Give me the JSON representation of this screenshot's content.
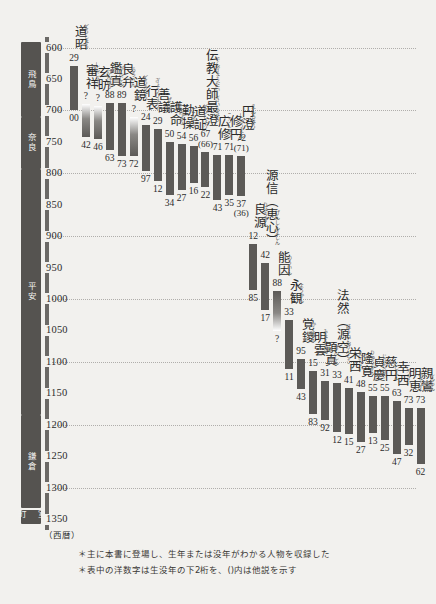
{
  "chart_data": {
    "type": "bar",
    "title": "",
    "xlabel": "",
    "ylabel": "西暦",
    "ylim": [
      575,
      1360
    ],
    "grid": true,
    "orientation": "vertical-range-bars",
    "axis_unit": "（西暦）",
    "ticks": [
      600,
      650,
      700,
      750,
      800,
      850,
      900,
      950,
      1000,
      1050,
      1100,
      1150,
      1200,
      1250,
      1300,
      1350
    ],
    "gridlines": [
      600,
      700,
      800,
      900,
      1000,
      1100,
      1200,
      1300
    ],
    "eras": [
      {
        "label": "飛鳥",
        "start": 592,
        "end": 710
      },
      {
        "label": "奈良",
        "start": 710,
        "end": 794
      },
      {
        "label": "平安",
        "start": 794,
        "end": 1185
      },
      {
        "label": "鎌倉",
        "start": 1185,
        "end": 1333
      },
      {
        "label": "室町",
        "start": 1336,
        "end": 1360
      }
    ],
    "categories": [
      "道昭",
      "審祥",
      "玄昉",
      "鑑真",
      "良弁",
      "道鏡",
      "行表",
      "善議",
      "護命",
      "勤操",
      "道証",
      "伝教大師最澄",
      "広修",
      "修円",
      "円澄",
      "良源",
      "源信（恵心）",
      "能因",
      "永観",
      "覚鑁",
      "明雲",
      "顕真",
      "法然（源空）",
      "栄西",
      "隆寛",
      "貞慶",
      "慈円",
      "幸西",
      "明恵",
      "親鸞"
    ],
    "series": [
      {
        "name": "道昭",
        "ruby": "どうしょう",
        "birth_label": "29",
        "death_label": "00",
        "birth_year": 629,
        "death_year": 700,
        "birth_alt": "",
        "death_alt": "",
        "fade_top": false,
        "fade_bottom": false
      },
      {
        "name": "審祥",
        "ruby": "しんじょう",
        "birth_label": "?",
        "death_label": "42",
        "birth_year": 690,
        "death_year": 742,
        "birth_alt": "",
        "death_alt": "",
        "fade_top": true,
        "fade_bottom": false
      },
      {
        "name": "玄昉",
        "ruby": "げんぼう",
        "birth_label": "?",
        "death_label": "46",
        "birth_year": 693,
        "death_year": 746,
        "birth_alt": "",
        "death_alt": "",
        "fade_top": true,
        "fade_bottom": false
      },
      {
        "name": "鑑真",
        "ruby": "がんじん",
        "birth_label": "88",
        "death_label": "63",
        "birth_year": 688,
        "death_year": 763,
        "birth_alt": "",
        "death_alt": "",
        "fade_top": false,
        "fade_bottom": false
      },
      {
        "name": "良弁",
        "ruby": "ろうべん",
        "birth_label": "89",
        "death_label": "73",
        "birth_year": 689,
        "death_year": 773,
        "birth_alt": "",
        "death_alt": "",
        "fade_top": false,
        "fade_bottom": false
      },
      {
        "name": "道鏡",
        "ruby": "どうきょう",
        "birth_label": "?",
        "death_label": "72",
        "birth_year": 710,
        "death_year": 772,
        "birth_alt": "",
        "death_alt": "",
        "fade_top": true,
        "fade_bottom": false
      },
      {
        "name": "行表",
        "ruby": "ぎょうひょう",
        "birth_label": "24",
        "death_label": "97",
        "birth_year": 724,
        "death_year": 797,
        "birth_alt": "",
        "death_alt": "",
        "fade_top": false,
        "fade_bottom": false
      },
      {
        "name": "善議",
        "ruby": "ぜんぎ",
        "birth_label": "29",
        "death_label": "12",
        "birth_year": 729,
        "death_year": 812,
        "birth_alt": "",
        "death_alt": "",
        "fade_top": false,
        "fade_bottom": false
      },
      {
        "name": "護命",
        "ruby": "ごみょう",
        "birth_label": "50",
        "death_label": "34",
        "birth_year": 750,
        "death_year": 834,
        "birth_alt": "",
        "death_alt": "",
        "fade_top": false,
        "fade_bottom": false
      },
      {
        "name": "勤操",
        "ruby": "ごんぞう",
        "birth_label": "54",
        "death_label": "27",
        "birth_year": 754,
        "death_year": 827,
        "birth_alt": "",
        "death_alt": "",
        "fade_top": false,
        "fade_bottom": false
      },
      {
        "name": "道証",
        "ruby": "どうしょう",
        "birth_label": "56",
        "death_label": "16",
        "birth_year": 756,
        "death_year": 816,
        "birth_alt": "",
        "death_alt": "",
        "fade_top": false,
        "fade_bottom": false
      },
      {
        "name": "伝教大師最澄",
        "ruby": "でんぎょうだいしさいちょう",
        "birth_label": "67",
        "death_label": "22",
        "birth_year": 767,
        "death_year": 822,
        "birth_alt": "(66)",
        "death_alt": "",
        "fade_top": false,
        "fade_bottom": false
      },
      {
        "name": "広修",
        "ruby": "こうしゅう",
        "birth_label": "71",
        "death_label": "43",
        "birth_year": 771,
        "death_year": 843,
        "birth_alt": "",
        "death_alt": "",
        "fade_top": false,
        "fade_bottom": false
      },
      {
        "name": "修円",
        "ruby": "しゅうえん",
        "birth_label": "71",
        "death_label": "35",
        "birth_year": 771,
        "death_year": 835,
        "birth_alt": "",
        "death_alt": "",
        "fade_top": false,
        "fade_bottom": false
      },
      {
        "name": "円澄",
        "ruby": "えんちょう",
        "birth_label": "72",
        "death_label": "37",
        "birth_year": 772,
        "death_year": 837,
        "birth_alt": "(71)",
        "death_alt": "(36)",
        "fade_top": false,
        "fade_bottom": false
      },
      {
        "name": "良源",
        "ruby": "りょうげん",
        "birth_label": "12",
        "death_label": "85",
        "birth_year": 912,
        "death_year": 985,
        "birth_alt": "",
        "death_alt": "",
        "fade_top": false,
        "fade_bottom": false
      },
      {
        "name": "源信（恵心）",
        "ruby": "げんしんえしん",
        "birth_label": "42",
        "death_label": "17",
        "birth_year": 942,
        "death_year": 1017,
        "birth_alt": "",
        "death_alt": "",
        "fade_top": false,
        "fade_bottom": false
      },
      {
        "name": "能因",
        "ruby": "のういん",
        "birth_label": "88",
        "death_label": "?",
        "birth_year": 988,
        "death_year": 1051,
        "birth_alt": "",
        "death_alt": "",
        "fade_top": false,
        "fade_bottom": true
      },
      {
        "name": "永観",
        "ruby": "ようかん",
        "birth_label": "33",
        "death_label": "11",
        "birth_year": 1033,
        "death_year": 1111,
        "birth_alt": "",
        "death_alt": "",
        "fade_top": false,
        "fade_bottom": false
      },
      {
        "name": "覚鑁",
        "ruby": "かくばん",
        "birth_label": "95",
        "death_label": "43",
        "birth_year": 1095,
        "death_year": 1143,
        "birth_alt": "",
        "death_alt": "",
        "fade_top": false,
        "fade_bottom": false
      },
      {
        "name": "明雲",
        "ruby": "みょううん",
        "birth_label": "15",
        "death_label": "83",
        "birth_year": 1115,
        "death_year": 1183,
        "birth_alt": "",
        "death_alt": "",
        "fade_top": false,
        "fade_bottom": false
      },
      {
        "name": "顕真",
        "ruby": "けんしん",
        "birth_label": "31",
        "death_label": "92",
        "birth_year": 1131,
        "death_year": 1192,
        "birth_alt": "",
        "death_alt": "",
        "fade_top": false,
        "fade_bottom": false
      },
      {
        "name": "法然（源空）",
        "ruby": "ほうねんげんくう",
        "birth_label": "33",
        "death_label": "12",
        "birth_year": 1133,
        "death_year": 1212,
        "birth_alt": "",
        "death_alt": "",
        "fade_top": false,
        "fade_bottom": false
      },
      {
        "name": "栄西",
        "ruby": "えいさい",
        "birth_label": "41",
        "death_label": "15",
        "birth_year": 1141,
        "death_year": 1215,
        "birth_alt": "",
        "death_alt": "",
        "fade_top": false,
        "fade_bottom": false
      },
      {
        "name": "隆寛",
        "ruby": "りゅうかん",
        "birth_label": "48",
        "death_label": "27",
        "birth_year": 1148,
        "death_year": 1227,
        "birth_alt": "",
        "death_alt": "",
        "fade_top": false,
        "fade_bottom": false
      },
      {
        "name": "貞慶",
        "ruby": "じょうけい",
        "birth_label": "55",
        "death_label": "13",
        "birth_year": 1155,
        "death_year": 1213,
        "birth_alt": "",
        "death_alt": "",
        "fade_top": false,
        "fade_bottom": false
      },
      {
        "name": "慈円",
        "ruby": "じえん",
        "birth_label": "55",
        "death_label": "25",
        "birth_year": 1155,
        "death_year": 1225,
        "birth_alt": "",
        "death_alt": "",
        "fade_top": false,
        "fade_bottom": false
      },
      {
        "name": "幸西",
        "ruby": "こうさい",
        "birth_label": "63",
        "death_label": "47",
        "birth_year": 1163,
        "death_year": 1247,
        "birth_alt": "",
        "death_alt": "",
        "fade_top": false,
        "fade_bottom": false
      },
      {
        "name": "明恵",
        "ruby": "みょうえ",
        "birth_label": "73",
        "death_label": "32",
        "birth_year": 1173,
        "death_year": 1232,
        "birth_alt": "",
        "death_alt": "",
        "fade_top": false,
        "fade_bottom": false
      },
      {
        "name": "親鸞",
        "ruby": "しんらん",
        "birth_label": "73",
        "death_label": "62",
        "birth_year": 1173,
        "death_year": 1262,
        "birth_alt": "",
        "death_alt": "",
        "fade_top": false,
        "fade_bottom": false
      }
    ]
  },
  "footnotes": [
    "＊主に本書に登場し、生年または没年がわかる人物を収録した",
    "＊表中の洋数字は生没年の下2桁を、()内は他説を示す"
  ],
  "colors": {
    "bar": "#5c5a57",
    "era_band": "#555350",
    "axis": "#6b6966",
    "gridline": "#b0aeab",
    "background": "#f2f1ee"
  }
}
